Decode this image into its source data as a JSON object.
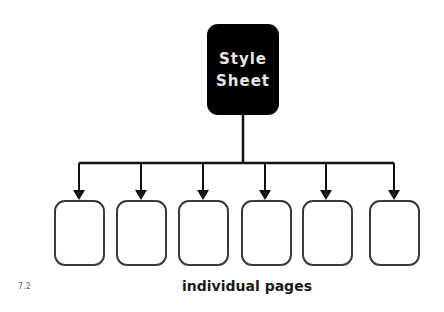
{
  "diagram": {
    "root": {
      "line1": "Style",
      "line2": "Sheet"
    },
    "children_count": 6,
    "caption": "individual pages",
    "figure_number": "7.2",
    "colors": {
      "root_fill": "#000000",
      "line": "#111111",
      "box_border": "#3a3a3a"
    }
  }
}
